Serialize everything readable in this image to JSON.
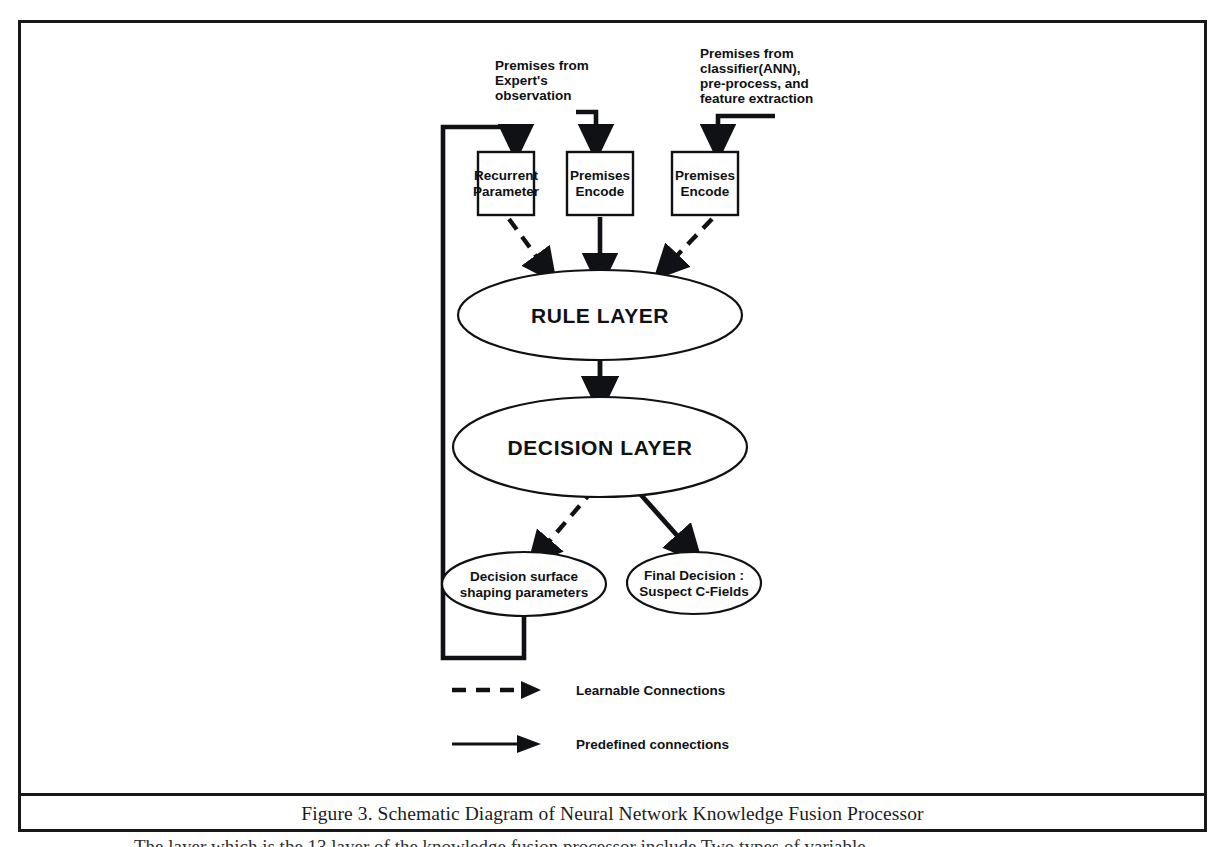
{
  "figure": {
    "caption": "Figure 3.  Schematic Diagram of Neural Network Knowledge Fusion Processor",
    "page_body_text": "The layer which is the 13 layer of the knowledge fusion processor include Two types of variable"
  },
  "colors": {
    "ink": "#17181a",
    "background": "#ffffff",
    "stroke": "#101114"
  },
  "annotations": [
    {
      "id": "expert-premises",
      "text_lines": [
        "Premises from",
        "Expert's",
        "observation"
      ]
    },
    {
      "id": "classifier-premises",
      "text_lines": [
        "Premises from",
        "classifier(ANN),",
        "pre-process, and",
        "feature extraction"
      ]
    }
  ],
  "nodes": {
    "boxes": [
      {
        "id": "recurrent-parameter",
        "lines": [
          "Recurrent",
          "Parameter"
        ]
      },
      {
        "id": "premises-encode-expert",
        "lines": [
          "Premises",
          "Encode"
        ]
      },
      {
        "id": "premises-encode-classifier",
        "lines": [
          "Premises",
          "Encode"
        ]
      }
    ],
    "ellipses": [
      {
        "id": "rule-layer",
        "lines": [
          "RULE LAYER"
        ],
        "size": "large"
      },
      {
        "id": "decision-layer",
        "lines": [
          "DECISION LAYER"
        ],
        "size": "large"
      },
      {
        "id": "decision-surface",
        "lines": [
          "Decision surface",
          "shaping parameters"
        ],
        "size": "small"
      },
      {
        "id": "final-decision",
        "lines": [
          "Final Decision :",
          "Suspect C-Fields"
        ],
        "size": "small"
      }
    ]
  },
  "legend": {
    "items": [
      {
        "id": "learnable",
        "style": "dashed",
        "label": "Learnable Connections"
      },
      {
        "id": "predefined",
        "style": "solid",
        "label": "Predefined connections"
      }
    ]
  },
  "connections": [
    {
      "from": "expert-premises-annotation",
      "to": "premises-encode-expert",
      "style": "solid"
    },
    {
      "from": "classifier-premises-annotation",
      "to": "premises-encode-classifier",
      "style": "solid"
    },
    {
      "from": "feedback-loop",
      "to": "recurrent-parameter",
      "style": "solid"
    },
    {
      "from": "recurrent-parameter",
      "to": "rule-layer",
      "style": "dashed"
    },
    {
      "from": "premises-encode-expert",
      "to": "rule-layer",
      "style": "solid"
    },
    {
      "from": "premises-encode-classifier",
      "to": "rule-layer",
      "style": "dashed"
    },
    {
      "from": "rule-layer",
      "to": "decision-layer",
      "style": "solid"
    },
    {
      "from": "decision-layer",
      "to": "decision-surface",
      "style": "dashed"
    },
    {
      "from": "decision-layer",
      "to": "final-decision",
      "style": "solid"
    },
    {
      "from": "decision-surface",
      "to": "feedback-loop",
      "style": "solid"
    }
  ]
}
